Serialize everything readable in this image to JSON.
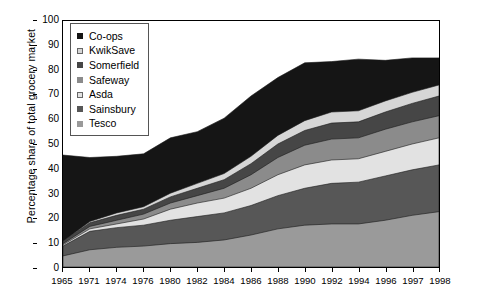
{
  "chart_data": {
    "type": "area",
    "stacked": true,
    "title": "",
    "xlabel": "",
    "ylabel": "Percentage share of total grocery market",
    "ylim": [
      0,
      100
    ],
    "ytick_labels": [
      "0",
      "10",
      "20",
      "30",
      "40",
      "50",
      "60",
      "70",
      "80",
      "90",
      "100"
    ],
    "ytick_values": [
      0,
      10,
      20,
      30,
      40,
      50,
      60,
      70,
      80,
      90,
      100
    ],
    "grid": false,
    "legend_position": "top-left",
    "x": [
      1965,
      1971,
      1974,
      1976,
      1980,
      1982,
      1984,
      1986,
      1988,
      1990,
      1992,
      1994,
      1996,
      1997,
      1998
    ],
    "categories": [
      "1965",
      "1971",
      "1974",
      "1976",
      "1980",
      "1982",
      "1984",
      "1986",
      "1988",
      "1990",
      "1992",
      "1994",
      "1996",
      "1997",
      "1998"
    ],
    "stack_order_bottom_to_top": [
      "Tesco",
      "Sainsbury",
      "Asda",
      "Safeway",
      "Somerfield",
      "KwikSave",
      "Co-ops"
    ],
    "series": [
      {
        "name": "Tesco",
        "color": "#9a9a9a",
        "values": [
          4.5,
          7.0,
          8.0,
          8.5,
          9.5,
          10.0,
          11.0,
          13.0,
          15.5,
          17.0,
          17.5,
          17.5,
          19.0,
          21.0,
          22.5
        ]
      },
      {
        "name": "Sainsbury",
        "color": "#575757",
        "values": [
          4.0,
          7.5,
          8.0,
          8.5,
          9.5,
          10.5,
          11.0,
          12.0,
          13.5,
          15.0,
          16.5,
          17.0,
          18.0,
          18.5,
          19.0
        ]
      },
      {
        "name": "Asda",
        "color": "#e2e2e2",
        "values": [
          0.5,
          1.0,
          1.5,
          2.5,
          4.5,
          5.5,
          6.0,
          7.0,
          8.5,
          9.5,
          9.5,
          9.5,
          10.0,
          10.5,
          11.0
        ]
      },
      {
        "name": "Safeway",
        "color": "#8b8b8b",
        "values": [
          0.5,
          1.0,
          1.5,
          2.0,
          2.5,
          3.0,
          4.0,
          5.5,
          7.0,
          8.0,
          8.5,
          8.5,
          9.0,
          9.0,
          9.0
        ]
      },
      {
        "name": "Somerfield",
        "color": "#464646",
        "values": [
          1.0,
          1.5,
          2.0,
          2.0,
          2.5,
          3.0,
          3.5,
          4.5,
          5.5,
          6.0,
          6.5,
          6.5,
          7.0,
          7.5,
          8.0
        ]
      },
      {
        "name": "KwikSave",
        "color": "#d6d6d6",
        "values": [
          0.0,
          0.5,
          1.0,
          1.0,
          1.5,
          2.0,
          2.5,
          3.0,
          3.5,
          4.0,
          4.5,
          4.5,
          4.5,
          4.5,
          4.5
        ]
      },
      {
        "name": "Co-ops",
        "color": "#151515",
        "values": [
          35.0,
          26.0,
          23.0,
          21.5,
          22.5,
          21.0,
          22.5,
          24.5,
          23.5,
          23.5,
          20.5,
          21.0,
          16.5,
          14.0,
          11.0
        ]
      }
    ],
    "stack_tops": {
      "Tesco": [
        4.5,
        7.0,
        8.0,
        8.5,
        9.5,
        10.0,
        11.0,
        13.0,
        15.5,
        17.0,
        17.5,
        17.5,
        19.0,
        21.0,
        22.5
      ],
      "Sainsbury": [
        8.5,
        14.5,
        16.0,
        17.0,
        19.0,
        20.5,
        22.0,
        25.0,
        29.0,
        32.0,
        34.0,
        34.5,
        37.0,
        39.5,
        41.5
      ],
      "Asda": [
        9.0,
        15.5,
        17.5,
        19.5,
        23.5,
        26.0,
        28.0,
        32.0,
        37.5,
        41.5,
        43.5,
        44.0,
        47.0,
        50.0,
        52.5
      ],
      "Safeway": [
        9.5,
        16.5,
        19.0,
        21.5,
        26.0,
        29.0,
        32.0,
        37.5,
        44.5,
        49.5,
        52.0,
        52.5,
        56.0,
        59.0,
        61.5
      ],
      "Somerfield": [
        10.5,
        18.0,
        21.0,
        23.5,
        28.5,
        32.0,
        35.5,
        42.0,
        50.0,
        55.5,
        58.5,
        59.0,
        63.0,
        66.5,
        69.5
      ],
      "KwikSave": [
        10.5,
        18.5,
        22.0,
        24.5,
        30.0,
        34.0,
        38.0,
        45.0,
        53.5,
        59.5,
        63.0,
        63.5,
        67.5,
        71.0,
        74.0
      ],
      "Co-ops": [
        45.5,
        44.5,
        45.0,
        46.0,
        52.5,
        55.0,
        60.5,
        69.5,
        77.0,
        83.0,
        83.5,
        84.5,
        84.0,
        85.0,
        85.0
      ]
    }
  },
  "legend": {
    "items": [
      {
        "label": "Co-ops",
        "color": "#151515"
      },
      {
        "label": "KwikSave",
        "color": "#d6d6d6"
      },
      {
        "label": "Somerfield",
        "color": "#464646"
      },
      {
        "label": "Safeway",
        "color": "#8b8b8b"
      },
      {
        "label": "Asda",
        "color": "#e2e2e2"
      },
      {
        "label": "Sainsbury",
        "color": "#575757"
      },
      {
        "label": "Tesco",
        "color": "#9a9a9a"
      }
    ]
  }
}
